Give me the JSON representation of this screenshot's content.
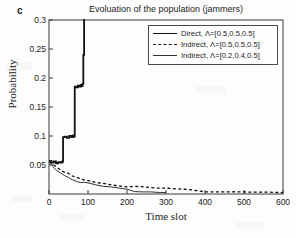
{
  "panel": {
    "label": "c"
  },
  "chart_data": {
    "type": "line",
    "title": "Evoluation of the population (jammers)",
    "xlabel": "Time slot",
    "ylabel": "Probability",
    "xlim": [
      0,
      600
    ],
    "ylim": [
      0,
      0.3
    ],
    "grid": false,
    "legend_position": "top-right",
    "xticks": [
      "0",
      "100",
      "200",
      "300",
      "400",
      "500",
      "600"
    ],
    "xtick_values": [
      0,
      100,
      200,
      300,
      400,
      500,
      600
    ],
    "yticks": [
      "0.05",
      "0.1",
      "0.15",
      "0.2",
      "0.25",
      "0.3"
    ],
    "ytick_values": [
      0.05,
      0.1,
      0.15,
      0.2,
      0.25,
      0.3
    ],
    "series": [
      {
        "name": "Direct, Λ=[0.5,0.5,0.5]",
        "style": "solid-thick",
        "color": "#111111",
        "x": [
          0,
          6,
          12,
          18,
          24,
          30,
          34,
          36,
          40,
          46,
          52,
          58,
          62,
          64,
          66,
          70,
          74,
          78,
          82,
          84,
          86,
          88,
          90,
          92
        ],
        "y": [
          0.057,
          0.054,
          0.056,
          0.053,
          0.055,
          0.054,
          0.056,
          0.098,
          0.099,
          0.097,
          0.1,
          0.098,
          0.101,
          0.099,
          0.185,
          0.184,
          0.187,
          0.185,
          0.188,
          0.186,
          0.19,
          0.24,
          0.3,
          0.3
        ]
      },
      {
        "name": "Indirect, Λ=[0.5,0.5,0.5]",
        "style": "dashed",
        "color": "#111111",
        "x": [
          0,
          10,
          20,
          30,
          40,
          50,
          60,
          70,
          80,
          90,
          100,
          120,
          140,
          160,
          180,
          200,
          220,
          240,
          260,
          280,
          300,
          330,
          360,
          400,
          440,
          480,
          520,
          560,
          600
        ],
        "y": [
          0.056,
          0.05,
          0.045,
          0.041,
          0.037,
          0.034,
          0.031,
          0.029,
          0.027,
          0.026,
          0.024,
          0.021,
          0.019,
          0.017,
          0.015,
          0.0135,
          0.012,
          0.011,
          0.0098,
          0.009,
          0.0082,
          0.0072,
          0.0065,
          0.0056,
          0.0049,
          0.0044,
          0.004,
          0.0037,
          0.0034
        ]
      },
      {
        "name": "Indirect, Λ=[0.2,0.4,0.5]",
        "style": "solid-thin",
        "color": "#333333",
        "x": [
          0,
          10,
          20,
          30,
          40,
          50,
          60,
          70,
          80,
          90,
          100,
          120,
          140,
          160,
          180,
          200,
          220,
          240,
          260,
          280,
          300
        ],
        "y": [
          0.055,
          0.048,
          0.042,
          0.037,
          0.033,
          0.029,
          0.026,
          0.023,
          0.021,
          0.019,
          0.0175,
          0.0145,
          0.0122,
          0.0102,
          0.0086,
          0.0072,
          0.006,
          0.005,
          0.0042,
          0.0035,
          0.003
        ]
      }
    ]
  }
}
